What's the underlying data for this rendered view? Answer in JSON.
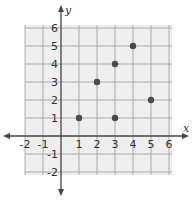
{
  "chart_data": {
    "type": "scatter",
    "title": "",
    "xlabel": "x",
    "ylabel": "y",
    "xlim": [
      -2,
      6
    ],
    "ylim": [
      -2,
      6
    ],
    "grid": true,
    "x_ticks": [
      "-2",
      "-1",
      "1",
      "2",
      "3",
      "4",
      "5",
      "6"
    ],
    "y_ticks": [
      "6",
      "5",
      "4",
      "3",
      "2",
      "1",
      "-1",
      "-2"
    ],
    "points": [
      {
        "x": 1,
        "y": 1
      },
      {
        "x": 2,
        "y": 3
      },
      {
        "x": 3,
        "y": 4
      },
      {
        "x": 3,
        "y": 1
      },
      {
        "x": 4,
        "y": 5
      },
      {
        "x": 5,
        "y": 2
      }
    ]
  },
  "colors": {
    "grid_fill": "#efefef",
    "grid_line": "#9a9a9a",
    "axis": "#444444",
    "point": "#4a4a4a"
  }
}
